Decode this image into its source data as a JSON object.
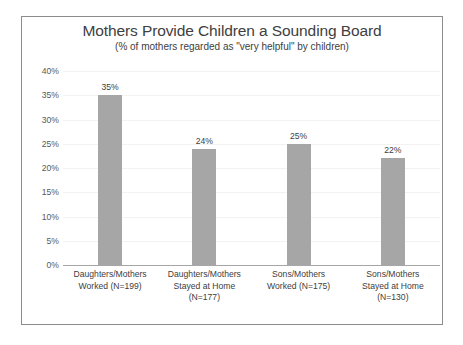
{
  "chart_data": {
    "type": "bar",
    "title": "Mothers Provide Children a Sounding Board",
    "subtitle": "(% of mothers regarded as \"very helpful\" by children)",
    "xlabel": "",
    "ylabel": "",
    "ylim": [
      0,
      40
    ],
    "ytick_labels": [
      "40%",
      "35%",
      "30%",
      "25%",
      "20%",
      "15%",
      "10%",
      "5%",
      "0%"
    ],
    "ytick_values": [
      40,
      35,
      30,
      25,
      20,
      15,
      10,
      5,
      0
    ],
    "grid": true,
    "legend": false,
    "bar_color": "#a6a6a6",
    "categories": [
      "Daughters/Mothers Worked (N=199)",
      "Daughters/Mothers Stayed at Home (N=177)",
      "Sons/Mothers Worked (N=175)",
      "Sons/Mothers Stayed at Home (N=130)"
    ],
    "values": [
      35,
      24,
      25,
      22
    ],
    "data_labels": [
      "35%",
      "24%",
      "25%",
      "22%"
    ],
    "points": [
      {
        "category": "Daughters/Mothers Worked (N=199)",
        "value": 35,
        "label": "35%",
        "n": 199
      },
      {
        "category": "Daughters/Mothers Stayed at Home (N=177)",
        "value": 24,
        "label": "24%",
        "n": 177
      },
      {
        "category": "Sons/Mothers Worked (N=175)",
        "value": 25,
        "label": "25%",
        "n": 175
      },
      {
        "category": "Sons/Mothers Stayed at Home (N=130)",
        "value": 22,
        "label": "22%",
        "n": 130
      }
    ],
    "category_lines": [
      [
        "Daughters/Mothers",
        "Worked (N=199)"
      ],
      [
        "Daughters/Mothers",
        "Stayed at Home",
        "(N=177)"
      ],
      [
        "Sons/Mothers",
        "Worked (N=175)"
      ],
      [
        "Sons/Mothers",
        "Stayed at Home",
        "(N=130)"
      ]
    ]
  }
}
